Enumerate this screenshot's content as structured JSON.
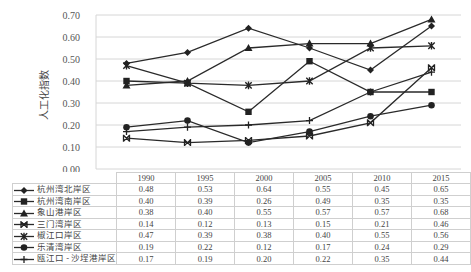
{
  "chart_data": {
    "type": "line",
    "title": "",
    "xlabel": "",
    "ylabel": "人工化指数",
    "ylim": [
      0.0,
      0.7
    ],
    "yticks": [
      "0.00",
      "0.10",
      "0.20",
      "0.30",
      "0.40",
      "0.50",
      "0.60",
      "0.70"
    ],
    "grid": true,
    "legend_position": "data-table-left",
    "categories": [
      "1990",
      "1995",
      "2000",
      "2005",
      "2010",
      "2015"
    ],
    "series": [
      {
        "name": "杭州湾北岸区",
        "marker": "diamond",
        "values": [
          0.48,
          0.53,
          0.64,
          0.55,
          0.45,
          0.65
        ]
      },
      {
        "name": "杭州湾南岸区",
        "marker": "square",
        "values": [
          0.4,
          0.39,
          0.26,
          0.49,
          0.35,
          0.35
        ]
      },
      {
        "name": "象山港岸区",
        "marker": "triangle",
        "values": [
          0.38,
          0.4,
          0.55,
          0.57,
          0.57,
          0.68
        ]
      },
      {
        "name": "三门湾岸区",
        "marker": "x-bar",
        "values": [
          0.14,
          0.12,
          0.13,
          0.15,
          0.21,
          0.46
        ]
      },
      {
        "name": "椒江口岸区",
        "marker": "star",
        "values": [
          0.47,
          0.39,
          0.38,
          0.4,
          0.55,
          0.56
        ]
      },
      {
        "name": "乐清湾岸区",
        "marker": "circle",
        "values": [
          0.19,
          0.22,
          0.12,
          0.17,
          0.24,
          0.29
        ]
      },
      {
        "name": "瓯江口 - 沙埕港岸区",
        "marker": "plus",
        "values": [
          0.17,
          0.19,
          0.2,
          0.22,
          0.35,
          0.44
        ]
      }
    ]
  }
}
